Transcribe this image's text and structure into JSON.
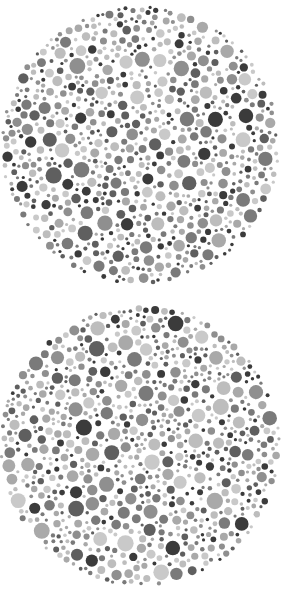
{
  "canvas": {
    "width": 281,
    "height": 601,
    "background": "#ffffff"
  },
  "palette": [
    "#3b3b3b",
    "#5f5f5f",
    "#7a7a7a",
    "#8f8f8f",
    "#a9a9a9",
    "#bdbdbd",
    "#c9c9c9"
  ],
  "plates": [
    {
      "name": "plate-1",
      "cx": 140,
      "cy": 145,
      "r": 140,
      "seed": 1337,
      "hidden_figure": ""
    },
    {
      "name": "plate-2",
      "cx": 140,
      "cy": 446,
      "r": 141,
      "seed": 4242,
      "hidden_figure": ""
    }
  ],
  "dots": {
    "min_r": 1.6,
    "max_r": 8.2,
    "gap": 1.1,
    "attempts": 9000
  }
}
